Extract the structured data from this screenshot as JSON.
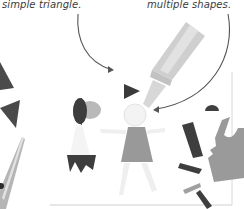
{
  "captions": {
    "left": "simple triangle.",
    "right": "multiple shapes."
  },
  "colors": {
    "dark": "#3f3f3f",
    "mid": "#8c8c8c",
    "light": "#c9c9c9",
    "pale": "#ececec",
    "arrow": "#555555",
    "paper_edge": "#cfcfcf"
  },
  "elements": [
    {
      "name": "paper-sheet",
      "kind": "rectangle"
    },
    {
      "name": "glue-bottle",
      "kind": "illustration"
    },
    {
      "name": "scissors",
      "kind": "illustration"
    },
    {
      "name": "left-figure",
      "kind": "paper-shape-figure"
    },
    {
      "name": "center-figure",
      "kind": "paper-shape-figure"
    },
    {
      "name": "dog-shape",
      "kind": "paper-shape"
    },
    {
      "name": "arrow-left",
      "kind": "curved-arrow"
    },
    {
      "name": "arrow-right",
      "kind": "curved-arrow"
    }
  ]
}
